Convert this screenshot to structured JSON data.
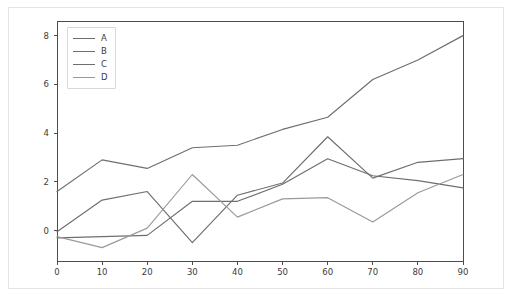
{
  "chart_data": {
    "type": "line",
    "title": "",
    "xlabel": "",
    "ylabel": "",
    "xlim": [
      0,
      90
    ],
    "ylim": [
      -1.25,
      8.6
    ],
    "xticks": [
      0,
      10,
      20,
      30,
      40,
      50,
      60,
      70,
      80,
      90
    ],
    "yticks": [
      0,
      2,
      4,
      6,
      8
    ],
    "grid": false,
    "legend_position": "upper left",
    "x": [
      0,
      10,
      20,
      30,
      40,
      50,
      60,
      70,
      80,
      90
    ],
    "series": [
      {
        "name": "A",
        "color": "#6e6e6e",
        "values": [
          1.6,
          2.9,
          2.55,
          3.4,
          3.5,
          4.15,
          4.65,
          6.2,
          7.0,
          8.0
        ]
      },
      {
        "name": "B",
        "color": "#6e6e6e",
        "values": [
          -0.05,
          1.25,
          1.6,
          -0.5,
          1.45,
          1.95,
          3.85,
          2.15,
          2.8,
          2.95
        ]
      },
      {
        "name": "C",
        "color": "#6e6e6e",
        "values": [
          -0.3,
          -0.25,
          -0.2,
          1.2,
          1.2,
          1.9,
          2.95,
          2.25,
          2.05,
          1.75
        ]
      },
      {
        "name": "D",
        "color": "#9a9a9a",
        "values": [
          -0.25,
          -0.7,
          0.1,
          2.3,
          0.55,
          1.3,
          1.35,
          0.35,
          1.55,
          2.3
        ]
      }
    ]
  },
  "axes": {
    "frame_color": "#4d4d4d",
    "tick_color": "#4d4d4d",
    "label_color": "#3b3b3b"
  },
  "figure": {
    "background": "#ffffff",
    "frame_color": "#e3e3e3"
  }
}
